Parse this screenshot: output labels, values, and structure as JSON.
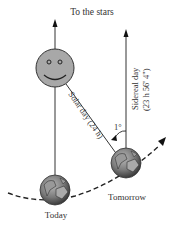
{
  "diagram": {
    "title": "To the stars",
    "labels": {
      "solar_day": "Solar day (24 h)",
      "sidereal_day_line1": "Sidereal day",
      "sidereal_day_line2": "(23 h 56' 4\")",
      "angle": "1°",
      "today": "Today",
      "tomorrow": "Tomorrow"
    },
    "objects": {
      "sun": "smiley-sun",
      "earth_today": "earth-globe",
      "earth_tomorrow": "earth-globe",
      "orbit": "dashed-orbit-arc"
    },
    "colors": {
      "line": "#222222",
      "sun_fill": "#a8a8a8",
      "earth_fill": "#7a7a7a",
      "text": "#333333"
    }
  }
}
